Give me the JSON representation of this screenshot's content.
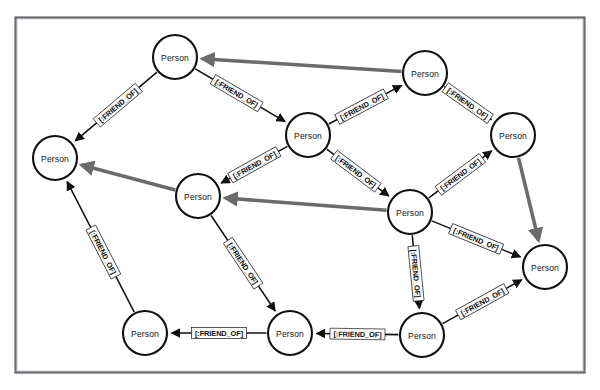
{
  "figure": {
    "background_color": "#ffffff",
    "frame": {
      "x": 15,
      "y": 17,
      "width": 570,
      "height": 356,
      "border_color": "#6a6a70"
    }
  },
  "style": {
    "node_fill": "#ffffff",
    "node_stroke": "#101010",
    "node_radius": 22,
    "edge_color": "#111111",
    "highlight_edge_color": "#6b6b6b",
    "label_bg": "#ffffff"
  },
  "graph": {
    "node_label": "Person",
    "relationship_label": "[:FRIEND_OF]",
    "node_count": 11,
    "edge_count": 14,
    "nodes": [
      {
        "id": "n1",
        "label": "Person",
        "x": 175,
        "y": 57
      },
      {
        "id": "n2",
        "label": "Person",
        "x": 425,
        "y": 73
      },
      {
        "id": "n3",
        "label": "Person",
        "x": 55,
        "y": 158
      },
      {
        "id": "n4",
        "label": "Person",
        "x": 308,
        "y": 135
      },
      {
        "id": "n5",
        "label": "Person",
        "x": 513,
        "y": 135
      },
      {
        "id": "n6",
        "label": "Person",
        "x": 198,
        "y": 196
      },
      {
        "id": "n7",
        "label": "Person",
        "x": 410,
        "y": 212
      },
      {
        "id": "n8",
        "label": "Person",
        "x": 545,
        "y": 267
      },
      {
        "id": "n9",
        "label": "Person",
        "x": 145,
        "y": 333
      },
      {
        "id": "n10",
        "label": "Person",
        "x": 290,
        "y": 333
      },
      {
        "id": "n11",
        "label": "Person",
        "x": 422,
        "y": 335
      }
    ],
    "edges": [
      {
        "id": "e1",
        "from": "n2",
        "to": "n1",
        "label": "",
        "highlight": true,
        "label_t": 0.5,
        "label_offset": 0
      },
      {
        "id": "e2",
        "from": "n1",
        "to": "n3",
        "label": "[:FRIEND_OF]",
        "highlight": false,
        "label_t": 0.48,
        "label_offset": 0
      },
      {
        "id": "e3",
        "from": "n1",
        "to": "n4",
        "label": "[:FRIEND_OF]",
        "highlight": false,
        "label_t": 0.46,
        "label_offset": 0
      },
      {
        "id": "e4",
        "from": "n4",
        "to": "n2",
        "label": "[:FRIEND_OF]",
        "highlight": false,
        "label_t": 0.45,
        "label_offset": 0
      },
      {
        "id": "e5",
        "from": "n2",
        "to": "n5",
        "label": "[:FRIEND_OF]",
        "highlight": false,
        "label_t": 0.5,
        "label_offset": 0
      },
      {
        "id": "e6",
        "from": "n4",
        "to": "n6",
        "label": "[:FRIEND_OF]",
        "highlight": false,
        "label_t": 0.5,
        "label_offset": 0
      },
      {
        "id": "e7",
        "from": "n4",
        "to": "n7",
        "label": "[:FRIEND_OF]",
        "highlight": false,
        "label_t": 0.47,
        "label_offset": 0
      },
      {
        "id": "e8",
        "from": "n7",
        "to": "n5",
        "label": "[:FRIEND_OF]",
        "highlight": false,
        "label_t": 0.5,
        "label_offset": 0
      },
      {
        "id": "e9",
        "from": "n5",
        "to": "n8",
        "label": "",
        "highlight": true,
        "label_t": 0.5,
        "label_offset": 0
      },
      {
        "id": "e10",
        "from": "n7",
        "to": "n6",
        "label": "",
        "highlight": true,
        "label_t": 0.5,
        "label_offset": 0
      },
      {
        "id": "e11",
        "from": "n6",
        "to": "n3",
        "label": "",
        "highlight": true,
        "label_t": 0.5,
        "label_offset": 0
      },
      {
        "id": "e12",
        "from": "n7",
        "to": "n8",
        "label": "[:FRIEND_OF]",
        "highlight": false,
        "label_t": 0.5,
        "label_offset": 0
      },
      {
        "id": "e13",
        "from": "n7",
        "to": "n11",
        "label": "[:FRIEND_OF]",
        "highlight": false,
        "label_t": 0.52,
        "label_offset": 0
      },
      {
        "id": "e14",
        "from": "n11",
        "to": "n8",
        "label": "[:FRIEND_OF]",
        "highlight": false,
        "label_t": 0.5,
        "label_offset": 0
      },
      {
        "id": "e15",
        "from": "n11",
        "to": "n10",
        "label": "[:FRIEND_OF]",
        "highlight": false,
        "label_t": 0.5,
        "label_offset": 0
      },
      {
        "id": "e16",
        "from": "n10",
        "to": "n9",
        "label": "[:FRIEND_OF]",
        "highlight": false,
        "label_t": 0.5,
        "label_offset": 0
      },
      {
        "id": "e17",
        "from": "n6",
        "to": "n10",
        "label": "[:FRIEND_OF]",
        "highlight": false,
        "label_t": 0.5,
        "label_offset": 0
      },
      {
        "id": "e18",
        "from": "n9",
        "to": "n3",
        "label": "[:FRIEND_OF]",
        "highlight": false,
        "label_t": 0.46,
        "label_offset": 0
      }
    ]
  }
}
